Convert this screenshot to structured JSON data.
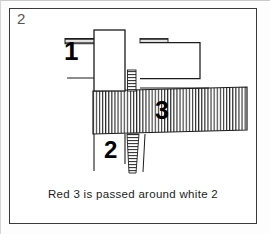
{
  "figure": {
    "step_number": "2",
    "caption": "Red 3 is passed around white 2",
    "labels": {
      "cord_1": "1",
      "cord_2": "2",
      "cord_3": "3"
    },
    "colors": {
      "ink": "#1c1c1c",
      "frame": "#3a3a3a",
      "hatch": "#333333",
      "paper": "#ffffff",
      "step_number_ink": "#555555"
    },
    "diagram": {
      "type": "knot-tying-step",
      "strands": [
        {
          "id": "cord_1",
          "label": "1",
          "fill": "white",
          "description": "white cord 1 enters from left, loops over the top and returns to the right"
        },
        {
          "id": "cord_2",
          "label": "2",
          "fill": "white",
          "description": "white cord 2 runs vertically down the centre, beneath the red band"
        },
        {
          "id": "cord_3",
          "label": "3",
          "fill": "hatched-red",
          "description": "red cord 3 forms the wide horizontal hatched band passed around white 2"
        }
      ]
    }
  }
}
